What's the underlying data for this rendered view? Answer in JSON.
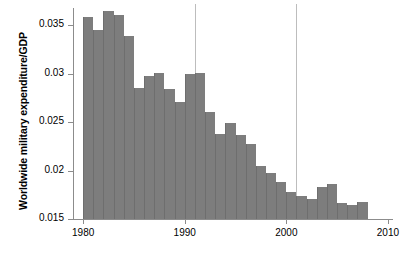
{
  "chart_data": {
    "type": "bar",
    "title": "",
    "subtitle": "",
    "xlabel": "",
    "ylabel": "Worldwide military expenditure/GDP",
    "xlim": [
      1979,
      2010.5
    ],
    "ylim": [
      0.015,
      0.0368
    ],
    "grid": false,
    "legend": null,
    "bar_color": "#7d7d7d",
    "axis_color": "#8c8c8c",
    "reference_line_color": "#bdbdbd",
    "baseline_value": 0.015,
    "x_ticks": [
      "1980",
      "1990",
      "2000",
      "2010"
    ],
    "x_tick_values": [
      1980,
      1990,
      2000,
      2010
    ],
    "y_ticks": [
      "0.015",
      "0.02",
      "0.025",
      "0.03",
      "0.035"
    ],
    "y_tick_values": [
      0.015,
      0.02,
      0.025,
      0.03,
      0.035
    ],
    "reference_lines": [
      {
        "name": "end-of-cold-war",
        "x": 1991
      },
      {
        "name": "post-9-11",
        "x": 2001
      }
    ],
    "categories": [
      1980,
      1981,
      1982,
      1983,
      1984,
      1985,
      1986,
      1987,
      1988,
      1989,
      1990,
      1991,
      1992,
      1993,
      1994,
      1995,
      1996,
      1997,
      1998,
      1999,
      2000,
      2001,
      2002,
      2003,
      2004,
      2005,
      2006,
      2007
    ],
    "values": [
      0.0359,
      0.0345,
      0.0365,
      0.0361,
      0.0339,
      0.0285,
      0.0298,
      0.0301,
      0.0284,
      0.0271,
      0.03,
      0.0301,
      0.0261,
      0.0238,
      0.0249,
      0.0237,
      0.0227,
      0.0205,
      0.0198,
      0.0188,
      0.0178,
      0.0174,
      0.0171,
      0.0183,
      0.0186,
      0.0167,
      0.0164,
      0.0168
    ]
  }
}
